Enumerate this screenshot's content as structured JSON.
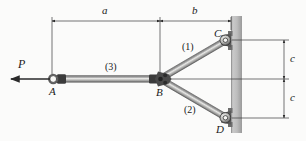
{
  "figure": {
    "type": "statics-truss-free-body-diagram",
    "background_color": "#fbfbfa",
    "ink_color": "#1a1a1a",
    "wall_color": "#b3b3b3"
  },
  "joints": [
    {
      "id": "A",
      "label": "A",
      "x": 52,
      "y": 79,
      "kind": "pin-eye",
      "label_dx": -3,
      "label_dy": 8
    },
    {
      "id": "B",
      "label": "B",
      "x": 160,
      "y": 79,
      "kind": "gusset",
      "label_dx": -3,
      "label_dy": 9
    },
    {
      "id": "C",
      "label": "C",
      "x": 228,
      "y": 40,
      "kind": "wall-pin",
      "label_dx": -13,
      "label_dy": -4
    },
    {
      "id": "D",
      "label": "D",
      "x": 228,
      "y": 118,
      "kind": "wall-pin",
      "label_dx": -11,
      "label_dy": 14
    }
  ],
  "members": [
    {
      "id": "1",
      "label": "(1)",
      "from": "B",
      "to": "C",
      "label_x": 186,
      "label_y": 48
    },
    {
      "id": "2",
      "label": "(2)",
      "from": "B",
      "to": "D",
      "label_x": 190,
      "label_y": 112
    },
    {
      "id": "3",
      "label": "(3)",
      "from": "A",
      "to": "B",
      "label_x": 112,
      "label_y": 67
    }
  ],
  "load": {
    "label": "P",
    "label_x": 18,
    "label_y": 64,
    "direction": "left",
    "tail_x": 52,
    "head_x": 10,
    "y": 79
  },
  "dimensions": [
    {
      "id": "a",
      "label": "a",
      "orientation": "horizontal",
      "from": 52,
      "to": 160,
      "axis": 21,
      "label_x": 102,
      "label_y": 6
    },
    {
      "id": "b",
      "label": "b",
      "orientation": "horizontal",
      "from": 160,
      "to": 231,
      "axis": 21,
      "label_x": 193,
      "label_y": 6
    },
    {
      "id": "c1",
      "label": "c",
      "orientation": "vertical",
      "from": 40,
      "to": 79,
      "axis": 284,
      "label_x": 289,
      "label_y": 54
    },
    {
      "id": "c2",
      "label": "c",
      "orientation": "vertical",
      "from": 79,
      "to": 118,
      "axis": 284,
      "label_x": 289,
      "label_y": 93
    }
  ],
  "wall": {
    "name": "fixed-support-wall",
    "x": 231,
    "y": 16,
    "width": 11,
    "height": 117
  }
}
